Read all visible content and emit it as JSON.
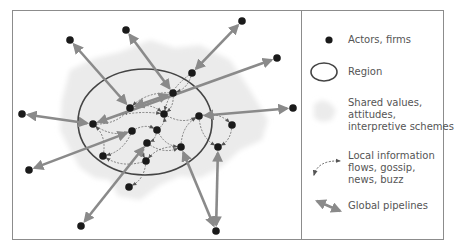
{
  "diagram": {
    "colors": {
      "frame": "#8c8c8c",
      "node": "#1a1a1a",
      "region": "#444444",
      "pipeline": "#8a8a8a",
      "local_flow": "#666666",
      "shared_values": "#ececec",
      "text": "#555555"
    },
    "region": {
      "cx": 145,
      "cy": 122,
      "rx": 67,
      "ry": 53
    },
    "nodes": [
      {
        "id": "o1",
        "x": 70,
        "y": 40,
        "group": "outer"
      },
      {
        "id": "o2",
        "x": 242,
        "y": 21,
        "group": "outer"
      },
      {
        "id": "o3",
        "x": 126,
        "y": 30,
        "group": "outer"
      },
      {
        "id": "o4",
        "x": 277,
        "y": 58,
        "group": "outer"
      },
      {
        "id": "o5",
        "x": 293,
        "y": 108,
        "group": "outer"
      },
      {
        "id": "o6",
        "x": 22,
        "y": 114,
        "group": "outer"
      },
      {
        "id": "o7",
        "x": 29,
        "y": 170,
        "group": "outer"
      },
      {
        "id": "o8",
        "x": 81,
        "y": 226,
        "group": "outer"
      },
      {
        "id": "o9",
        "x": 216,
        "y": 231,
        "group": "outer"
      },
      {
        "id": "i1",
        "x": 192,
        "y": 73,
        "group": "inner"
      },
      {
        "id": "i2",
        "x": 173,
        "y": 93,
        "group": "inner"
      },
      {
        "id": "i3",
        "x": 130,
        "y": 108,
        "group": "inner"
      },
      {
        "id": "i4",
        "x": 164,
        "y": 114,
        "group": "inner"
      },
      {
        "id": "i5",
        "x": 199,
        "y": 116,
        "group": "inner"
      },
      {
        "id": "i6",
        "x": 232,
        "y": 125,
        "group": "inner"
      },
      {
        "id": "i7",
        "x": 93,
        "y": 124,
        "group": "inner"
      },
      {
        "id": "i8",
        "x": 132,
        "y": 131,
        "group": "inner"
      },
      {
        "id": "i9",
        "x": 157,
        "y": 130,
        "group": "inner"
      },
      {
        "id": "i10",
        "x": 147,
        "y": 143,
        "group": "inner"
      },
      {
        "id": "i11",
        "x": 181,
        "y": 147,
        "group": "inner"
      },
      {
        "id": "i12",
        "x": 218,
        "y": 147,
        "group": "inner"
      },
      {
        "id": "i13",
        "x": 103,
        "y": 156,
        "group": "inner"
      },
      {
        "id": "i14",
        "x": 146,
        "y": 161,
        "group": "inner"
      },
      {
        "id": "i15",
        "x": 129,
        "y": 187,
        "group": "inner"
      }
    ],
    "pipelines": [
      [
        "o1",
        "i3"
      ],
      [
        "o3",
        "i2"
      ],
      [
        "o2",
        "i1"
      ],
      [
        "o4",
        "i7"
      ],
      [
        "o5",
        "i5"
      ],
      [
        "o6",
        "i7"
      ],
      [
        "o7",
        "i8"
      ],
      [
        "o8",
        "i10"
      ],
      [
        "o9",
        "i11"
      ],
      [
        "o9",
        "i12"
      ],
      [
        "i3",
        "i2"
      ]
    ],
    "local_flows": [
      [
        "i1",
        "i2"
      ],
      [
        "i2",
        "i3"
      ],
      [
        "i3",
        "i4"
      ],
      [
        "i4",
        "i5"
      ],
      [
        "i5",
        "i6"
      ],
      [
        "i7",
        "i3"
      ],
      [
        "i7",
        "i4"
      ],
      [
        "i7",
        "i8"
      ],
      [
        "i8",
        "i9"
      ],
      [
        "i9",
        "i4"
      ],
      [
        "i9",
        "i10"
      ],
      [
        "i10",
        "i11"
      ],
      [
        "i11",
        "i5"
      ],
      [
        "i5",
        "i12"
      ],
      [
        "i6",
        "i12"
      ],
      [
        "i10",
        "i14"
      ],
      [
        "i14",
        "i13"
      ],
      [
        "i13",
        "i7"
      ],
      [
        "i14",
        "i15"
      ],
      [
        "i11",
        "i14"
      ],
      [
        "i2",
        "i4"
      ],
      [
        "i1",
        "i4"
      ],
      [
        "i8",
        "i13"
      ],
      [
        "i9",
        "i11"
      ]
    ]
  },
  "legend": {
    "items": [
      {
        "key": "actors",
        "lines": [
          "Actors, firms"
        ]
      },
      {
        "key": "region",
        "lines": [
          "Region"
        ]
      },
      {
        "key": "shared",
        "lines": [
          "Shared values,",
          "attitudes,",
          "interpretive schemes"
        ]
      },
      {
        "key": "flows",
        "lines": [
          "Local information",
          "flows, gossip,",
          "news, buzz"
        ]
      },
      {
        "key": "pipelines",
        "lines": [
          "Global pipelines"
        ]
      }
    ],
    "actors_label": "Actors, firms",
    "region_label": "Region",
    "shared_label_1": "Shared values,",
    "shared_label_2": "attitudes,",
    "shared_label_3": "interpretive schemes",
    "flows_label_1": "Local information",
    "flows_label_2": "flows, gossip,",
    "flows_label_3": "news, buzz",
    "pipelines_label": "Global pipelines"
  }
}
